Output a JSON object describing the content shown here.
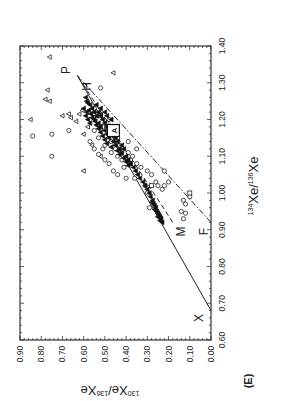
{
  "figure": {
    "panel_label": "(E)",
    "rotation_note": "Figure rotated 90 degrees counter-clockwise on page"
  },
  "chart_data": {
    "type": "scatter",
    "title": "",
    "xlabel": "134Xe/136Xe",
    "xlabel_parts": {
      "sup1": "134",
      "base1": "Xe/",
      "sup2": "136",
      "base2": "Xe"
    },
    "ylabel": "130Xe/136Xe",
    "ylabel_parts": {
      "sup1": "130",
      "base1": "Xe/",
      "sup2": "136",
      "base2": "Xe"
    },
    "xlim": [
      0.6,
      1.4
    ],
    "ylim": [
      0.0,
      0.9
    ],
    "x_ticks": [
      "0.60",
      "0.70",
      "0.80",
      "0.90",
      "1.00",
      "1.10",
      "1.20",
      "1.30",
      "1.40"
    ],
    "y_ticks": [
      "0.00",
      "0.10",
      "0.20",
      "0.30",
      "0.40",
      "0.50",
      "0.60",
      "0.70",
      "0.80",
      "0.90"
    ],
    "grid": false,
    "lines": [
      {
        "name": "X-P mixing line",
        "style": "solid",
        "from": [
          0.68,
          0.0
        ],
        "to": [
          1.32,
          0.63
        ]
      },
      {
        "name": "M-P mixing line",
        "style": "dashed",
        "from": [
          0.92,
          0.18
        ],
        "to": [
          1.32,
          0.63
        ]
      },
      {
        "name": "F-P mixing line",
        "style": "dashdot",
        "from": [
          0.92,
          0.0
        ],
        "to": [
          1.32,
          0.63
        ]
      }
    ],
    "annotations": [
      {
        "text": "P",
        "x": 1.335,
        "y": 0.685
      },
      {
        "text": "H",
        "x": 1.29,
        "y": 0.585
      },
      {
        "text": "A",
        "x": 1.17,
        "y": 0.46,
        "boxed": true
      },
      {
        "text": "M",
        "x": 0.895,
        "y": 0.14
      },
      {
        "text": "F",
        "x": 0.895,
        "y": 0.035
      },
      {
        "text": "X",
        "x": 0.66,
        "y": 0.055
      }
    ],
    "series": [
      {
        "name": "triangles (outliers)",
        "marker": "triangle",
        "points": [
          [
            1.37,
            0.76
          ],
          [
            1.28,
            0.77
          ],
          [
            1.255,
            0.78
          ],
          [
            1.25,
            0.76
          ],
          [
            1.2,
            0.85
          ],
          [
            1.21,
            0.7
          ],
          [
            1.215,
            0.67
          ],
          [
            1.205,
            0.66
          ],
          [
            1.06,
            0.6
          ],
          [
            1.327,
            0.46
          ],
          [
            1.195,
            0.635
          ],
          [
            1.215,
            0.62
          ],
          [
            1.16,
            0.6
          ],
          [
            1.13,
            0.56
          ],
          [
            1.18,
            0.58
          ],
          [
            1.225,
            0.605
          ],
          [
            1.1,
            0.52
          ]
        ]
      },
      {
        "name": "circles",
        "marker": "circle",
        "points": [
          [
            1.155,
            0.84
          ],
          [
            1.16,
            0.75
          ],
          [
            1.1,
            0.75
          ],
          [
            1.17,
            0.67
          ],
          [
            1.286,
            0.52
          ],
          [
            1.12,
            0.55
          ],
          [
            1.105,
            0.53
          ],
          [
            1.14,
            0.57
          ],
          [
            1.15,
            0.53
          ],
          [
            1.17,
            0.55
          ],
          [
            1.12,
            0.51
          ],
          [
            1.09,
            0.5
          ],
          [
            1.11,
            0.47
          ],
          [
            1.08,
            0.48
          ],
          [
            1.06,
            0.46
          ],
          [
            1.04,
            0.4
          ],
          [
            1.05,
            0.44
          ],
          [
            1.13,
            0.5
          ],
          [
            1.14,
            0.47
          ],
          [
            1.12,
            0.45
          ],
          [
            1.1,
            0.44
          ],
          [
            1.09,
            0.42
          ],
          [
            1.13,
            0.43
          ],
          [
            1.15,
            0.44
          ],
          [
            1.1,
            0.37
          ],
          [
            1.08,
            0.35
          ],
          [
            1.07,
            0.33
          ],
          [
            1.06,
            0.3
          ],
          [
            1.05,
            0.28
          ],
          [
            1.03,
            0.26
          ],
          [
            1.02,
            0.25
          ],
          [
            1.01,
            0.23
          ],
          [
            1.02,
            0.22
          ],
          [
            0.98,
            0.13
          ],
          [
            0.97,
            0.12
          ],
          [
            0.95,
            0.14
          ],
          [
            0.945,
            0.12
          ],
          [
            0.93,
            0.13
          ],
          [
            0.99,
            0.1
          ],
          [
            0.96,
            0.29
          ],
          [
            1.02,
            0.31
          ],
          [
            1.04,
            0.36
          ],
          [
            1.07,
            0.41
          ],
          [
            1.09,
            0.38
          ],
          [
            1.11,
            0.39
          ],
          [
            1.12,
            0.35
          ],
          [
            1.23,
            0.55
          ],
          [
            1.19,
            0.49
          ],
          [
            1.18,
            0.52
          ],
          [
            1.16,
            0.48
          ],
          [
            1.2,
            0.48
          ],
          [
            1.14,
            0.39
          ],
          [
            1.06,
            0.22
          ],
          [
            1.03,
            0.2
          ],
          [
            1.0,
            0.3
          ]
        ]
      },
      {
        "name": "squares",
        "marker": "square",
        "points": [
          [
            1.0,
            0.1
          ],
          [
            1.02,
            0.28
          ],
          [
            1.21,
            0.52
          ],
          [
            1.18,
            0.51
          ],
          [
            1.08,
            0.38
          ]
        ]
      },
      {
        "name": "filled (dense cluster)",
        "marker": "filled",
        "points": [
          [
            1.23,
            0.56
          ],
          [
            1.22,
            0.55
          ],
          [
            1.21,
            0.54
          ],
          [
            1.2,
            0.55
          ],
          [
            1.22,
            0.53
          ],
          [
            1.21,
            0.52
          ],
          [
            1.19,
            0.53
          ],
          [
            1.2,
            0.51
          ],
          [
            1.18,
            0.52
          ],
          [
            1.19,
            0.5
          ],
          [
            1.17,
            0.5
          ],
          [
            1.18,
            0.49
          ],
          [
            1.16,
            0.49
          ],
          [
            1.17,
            0.47
          ],
          [
            1.15,
            0.48
          ],
          [
            1.16,
            0.46
          ],
          [
            1.14,
            0.46
          ],
          [
            1.15,
            0.45
          ],
          [
            1.13,
            0.45
          ],
          [
            1.14,
            0.44
          ],
          [
            1.12,
            0.43
          ],
          [
            1.13,
            0.42
          ],
          [
            1.11,
            0.42
          ],
          [
            1.12,
            0.41
          ],
          [
            1.1,
            0.4
          ],
          [
            1.24,
            0.57
          ],
          [
            1.245,
            0.58
          ],
          [
            1.25,
            0.585
          ],
          [
            1.26,
            0.59
          ],
          [
            1.225,
            0.575
          ],
          [
            1.215,
            0.565
          ],
          [
            1.205,
            0.56
          ],
          [
            1.195,
            0.545
          ],
          [
            1.185,
            0.54
          ],
          [
            1.175,
            0.53
          ],
          [
            1.165,
            0.52
          ],
          [
            1.155,
            0.51
          ],
          [
            1.145,
            0.5
          ],
          [
            1.135,
            0.49
          ],
          [
            1.125,
            0.47
          ],
          [
            1.2,
            0.58
          ],
          [
            1.19,
            0.57
          ],
          [
            1.21,
            0.59
          ],
          [
            1.23,
            0.6
          ],
          [
            1.22,
            0.585
          ],
          [
            1.24,
            0.54
          ],
          [
            1.23,
            0.52
          ],
          [
            1.22,
            0.5
          ],
          [
            1.21,
            0.49
          ],
          [
            1.2,
            0.47
          ],
          [
            1.09,
            0.39
          ],
          [
            1.08,
            0.38
          ],
          [
            1.07,
            0.365
          ],
          [
            1.06,
            0.355
          ],
          [
            1.05,
            0.345
          ],
          [
            1.04,
            0.335
          ],
          [
            1.03,
            0.32
          ],
          [
            1.02,
            0.31
          ],
          [
            1.01,
            0.3
          ],
          [
            1.0,
            0.29
          ],
          [
            0.99,
            0.285
          ],
          [
            0.98,
            0.275
          ],
          [
            0.97,
            0.27
          ],
          [
            0.965,
            0.265
          ],
          [
            0.96,
            0.26
          ],
          [
            0.95,
            0.255
          ],
          [
            0.945,
            0.25
          ],
          [
            0.94,
            0.245
          ],
          [
            0.935,
            0.24
          ],
          [
            0.93,
            0.235
          ],
          [
            0.925,
            0.24
          ],
          [
            0.92,
            0.23
          ],
          [
            0.935,
            0.25
          ],
          [
            0.955,
            0.265
          ],
          [
            0.975,
            0.28
          ],
          [
            1.115,
            0.44
          ],
          [
            1.105,
            0.43
          ],
          [
            1.095,
            0.41
          ],
          [
            1.085,
            0.4
          ],
          [
            1.075,
            0.39
          ]
        ]
      }
    ]
  }
}
